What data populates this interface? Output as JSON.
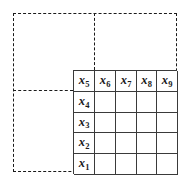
{
  "figure": {
    "name": "labelled-grid-with-dashed-region",
    "background_color": "#ffffff",
    "grid_line_color": "#3a3a3a",
    "dashed_line_color": "#1a1a1a",
    "text_color": "#1a1a1a"
  },
  "grid": {
    "rows": 5,
    "columns": 5,
    "bounds": {
      "left": 73,
      "top": 70,
      "right": 177,
      "bottom": 174
    },
    "column_edges": [
      73,
      94,
      115,
      136,
      156,
      177
    ],
    "row_edges": [
      70,
      91,
      112,
      132,
      153,
      174
    ],
    "top_row_labels": [
      "x5",
      "x6",
      "x7",
      "x8",
      "x9"
    ],
    "left_column_labels": [
      "x5",
      "x4",
      "x3",
      "x2",
      "x1"
    ],
    "cells": [
      [
        {
          "var": "x",
          "sub": "5",
          "blank": false
        },
        {
          "var": "x",
          "sub": "6",
          "blank": false
        },
        {
          "var": "x",
          "sub": "7",
          "blank": false
        },
        {
          "var": "x",
          "sub": "8",
          "blank": false
        },
        {
          "var": "x",
          "sub": "9",
          "blank": false
        }
      ],
      [
        {
          "var": "x",
          "sub": "4",
          "blank": false
        },
        {
          "var": "",
          "sub": "",
          "blank": true
        },
        {
          "var": "",
          "sub": "",
          "blank": true
        },
        {
          "var": "",
          "sub": "",
          "blank": true
        },
        {
          "var": "",
          "sub": "",
          "blank": true
        }
      ],
      [
        {
          "var": "x",
          "sub": "3",
          "blank": false
        },
        {
          "var": "",
          "sub": "",
          "blank": true
        },
        {
          "var": "",
          "sub": "",
          "blank": true
        },
        {
          "var": "",
          "sub": "",
          "blank": true
        },
        {
          "var": "",
          "sub": "",
          "blank": true
        }
      ],
      [
        {
          "var": "x",
          "sub": "2",
          "blank": false
        },
        {
          "var": "",
          "sub": "",
          "blank": true
        },
        {
          "var": "",
          "sub": "",
          "blank": true
        },
        {
          "var": "",
          "sub": "",
          "blank": true
        },
        {
          "var": "",
          "sub": "",
          "blank": true
        }
      ],
      [
        {
          "var": "x",
          "sub": "1",
          "blank": false
        },
        {
          "var": "",
          "sub": "",
          "blank": true
        },
        {
          "var": "",
          "sub": "",
          "blank": true
        },
        {
          "var": "",
          "sub": "",
          "blank": true
        },
        {
          "var": "",
          "sub": "",
          "blank": true
        }
      ]
    ]
  },
  "dashed_region": {
    "outer_rect": {
      "left": 13,
      "top": 13,
      "right": 177,
      "bottom": 172
    },
    "vertical_divider_x": 94,
    "horizontal_divider_y": 90
  }
}
